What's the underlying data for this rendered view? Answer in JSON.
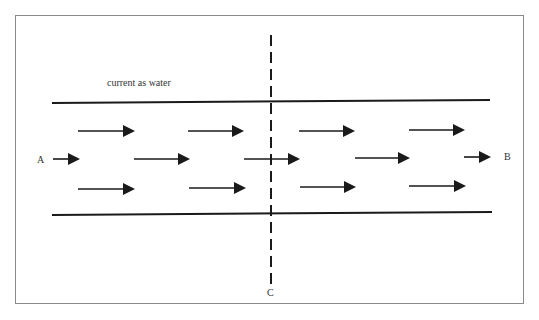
{
  "diagram": {
    "title": "current as water",
    "labels": {
      "a": "A",
      "b": "B",
      "c": "C"
    },
    "colors": {
      "line": "#1a1a1a",
      "frame": "#8a8a8a",
      "text": "#333333"
    },
    "channel": {
      "top_y": 102,
      "bottom_y": 213,
      "x_start": 52,
      "x_end": 490
    },
    "cross_section": {
      "x": 271,
      "y_start": 35,
      "y_end": 290,
      "style": "dashed"
    },
    "arrows": [
      {
        "row": 1,
        "x1": 78,
        "x2": 135,
        "y": 131
      },
      {
        "row": 1,
        "x1": 188,
        "x2": 244,
        "y": 131
      },
      {
        "row": 1,
        "x1": 299,
        "x2": 355,
        "y": 131
      },
      {
        "row": 1,
        "x1": 409,
        "x2": 465,
        "y": 130
      },
      {
        "row": 2,
        "x1": 53,
        "x2": 80,
        "y": 159
      },
      {
        "row": 2,
        "x1": 134,
        "x2": 190,
        "y": 159
      },
      {
        "row": 2,
        "x1": 244,
        "x2": 300,
        "y": 159
      },
      {
        "row": 2,
        "x1": 355,
        "x2": 410,
        "y": 158
      },
      {
        "row": 2,
        "x1": 464,
        "x2": 491,
        "y": 157
      },
      {
        "row": 3,
        "x1": 78,
        "x2": 135,
        "y": 189
      },
      {
        "row": 3,
        "x1": 189,
        "x2": 246,
        "y": 188
      },
      {
        "row": 3,
        "x1": 300,
        "x2": 356,
        "y": 187
      },
      {
        "row": 3,
        "x1": 409,
        "x2": 466,
        "y": 186
      }
    ]
  }
}
